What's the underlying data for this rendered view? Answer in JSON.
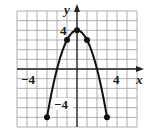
{
  "chart_data": {
    "type": "line",
    "title": "",
    "xlabel": "x",
    "ylabel": "y",
    "xlim": [
      -6,
      6
    ],
    "ylim": [
      -6,
      6
    ],
    "grid": true,
    "tick_labels": {
      "x": [
        {
          "value": -4,
          "label": "−4"
        },
        {
          "value": 4,
          "label": "4"
        }
      ],
      "y": [
        {
          "value": 4,
          "label": "4"
        },
        {
          "value": -4,
          "label": "−4"
        }
      ]
    },
    "series": [
      {
        "name": "y = 4 − x²",
        "curve": "parabola",
        "x_range": [
          -3,
          3
        ],
        "points": [
          {
            "x": -3,
            "y": -5
          },
          {
            "x": -1,
            "y": 3
          },
          {
            "x": 0,
            "y": 4
          },
          {
            "x": 1,
            "y": 3
          },
          {
            "x": 3,
            "y": -5
          }
        ],
        "color": "#111111"
      }
    ]
  },
  "labels": {
    "x_axis": "x",
    "y_axis": "y",
    "x_neg4": "−4",
    "x_pos4": "4",
    "y_pos4": "4",
    "y_neg4": "−4"
  }
}
